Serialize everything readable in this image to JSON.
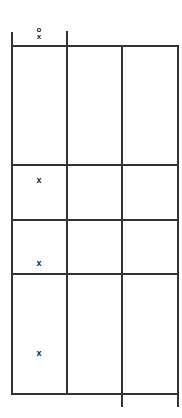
{
  "diagram": {
    "type": "grid-table",
    "columns": 3,
    "rows": 4,
    "header": {
      "column_1_symbol_top": "o",
      "column_1_symbol_bottom": "x"
    },
    "rows_data": [
      {
        "index": 1,
        "column_1_mark": ""
      },
      {
        "index": 2,
        "column_1_mark": "x"
      },
      {
        "index": 3,
        "column_1_mark": "x"
      },
      {
        "index": 4,
        "column_1_mark": "x"
      }
    ],
    "line_color": "#333333",
    "background": "#ffffff"
  }
}
